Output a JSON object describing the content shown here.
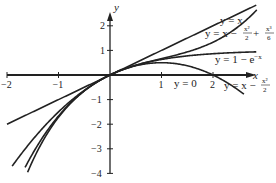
{
  "chart_data": {
    "type": "line",
    "title": "",
    "xlabel": "x",
    "ylabel": "y",
    "xlim": [
      -2,
      2.2
    ],
    "ylim": [
      -4,
      2.4
    ],
    "grid": false,
    "x_ticks": [
      "-2",
      "-1",
      "1",
      "2"
    ],
    "y_ticks": [
      "2",
      "1",
      "-1",
      "-2",
      "-3",
      "-4"
    ],
    "series": [
      {
        "name": "y = x",
        "expression": "x"
      },
      {
        "name": "y = x - x^2/2 + x^3/6",
        "expression": "x - x^2/2 + x^3/6"
      },
      {
        "name": "y = 1 - e^-x",
        "expression": "1 - exp(-x)"
      },
      {
        "name": "y = x - x^2/2",
        "expression": "x - x^2/2"
      },
      {
        "name": "y = 0",
        "expression": "0"
      }
    ],
    "annotations": [
      {
        "text": "y = x",
        "near": [
          1.9,
          2.05
        ]
      },
      {
        "text": "y = x - x²/2 + x³/6",
        "near": [
          2.0,
          1.6
        ]
      },
      {
        "text": "y = 1 - e^{-x}",
        "near": [
          2.1,
          0.6
        ]
      },
      {
        "text": "y = 0",
        "near": [
          1.5,
          -0.15
        ]
      },
      {
        "text": "y = x - x²/2",
        "near": [
          2.1,
          -0.3
        ]
      }
    ]
  },
  "labels": {
    "x_axis": "x",
    "y_axis": "y",
    "y_eq_x": "y = x",
    "taylor3": "y = x − ",
    "taylor3_b": " + ",
    "exp": "y = 1 − e",
    "exp_sup": "−x",
    "zero": "y = 0",
    "taylor2": "y = x − ",
    "frac_x2_num": "x²",
    "frac_x3_num": "x³",
    "frac_den2": "2",
    "frac_den6": "6"
  }
}
